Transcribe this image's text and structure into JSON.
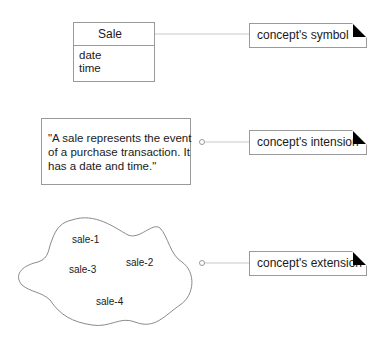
{
  "symbol": {
    "class_name": "Sale",
    "attributes": [
      "date",
      "time"
    ]
  },
  "intension": {
    "text": "\"A sale represents the event\nof a purchase transaction. It\nhas a date and time.\""
  },
  "extension": {
    "instances": [
      "sale-1",
      "sale-2",
      "sale-3",
      "sale-4"
    ]
  },
  "notes": [
    {
      "label": "concept's symbol"
    },
    {
      "label": "concept's intension"
    },
    {
      "label": "concept's extension"
    }
  ],
  "colors": {
    "border": "#9a9a9a",
    "connector": "#c8c8c8",
    "fold": "#000000"
  }
}
